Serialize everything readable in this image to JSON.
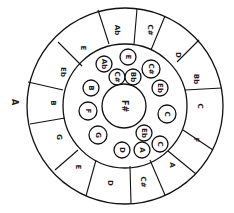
{
  "diagram": {
    "marker_label": "A",
    "center_label": "F#",
    "outer_ring": [
      {
        "label": "Ab",
        "x": 117,
        "y": 30,
        "rot": 90
      },
      {
        "label": "C#",
        "x": 150,
        "y": 30,
        "rot": 90
      },
      {
        "label": "D",
        "x": 178,
        "y": 55,
        "rot": 90
      },
      {
        "label": "Bb",
        "x": 196,
        "y": 79,
        "rot": 90
      },
      {
        "label": "C",
        "x": 200,
        "y": 106,
        "rot": 90
      },
      {
        "label": "F",
        "x": 196,
        "y": 140,
        "rot": 90
      },
      {
        "label": "A",
        "x": 172,
        "y": 165,
        "rot": 90
      },
      {
        "label": "C#",
        "x": 143,
        "y": 182,
        "rot": 90
      },
      {
        "label": "D",
        "x": 110,
        "y": 183,
        "rot": 90
      },
      {
        "label": "E",
        "x": 78,
        "y": 167,
        "rot": 90
      },
      {
        "label": "G",
        "x": 59,
        "y": 137,
        "rot": 90
      },
      {
        "label": "B",
        "x": 53,
        "y": 103,
        "rot": 90
      },
      {
        "label": "Eb",
        "x": 63,
        "y": 72,
        "rot": 90
      },
      {
        "label": "E",
        "x": 83,
        "y": 48,
        "rot": 90
      }
    ],
    "inner_circles": [
      {
        "label": "Ab",
        "x": 104,
        "y": 64,
        "r": 8
      },
      {
        "label": "E",
        "x": 128,
        "y": 57,
        "r": 8
      },
      {
        "label": "C#",
        "x": 117,
        "y": 77,
        "r": 8
      },
      {
        "label": "Bb",
        "x": 133,
        "y": 77,
        "r": 8
      },
      {
        "label": "C#",
        "x": 151,
        "y": 69,
        "r": 9
      },
      {
        "label": "Eb",
        "x": 160,
        "y": 88,
        "r": 8
      },
      {
        "label": "C",
        "x": 167,
        "y": 114,
        "r": 9
      },
      {
        "label": "Eb",
        "x": 144,
        "y": 133,
        "r": 8
      },
      {
        "label": "C",
        "x": 160,
        "y": 144,
        "r": 8
      },
      {
        "label": "A",
        "x": 142,
        "y": 150,
        "r": 8
      },
      {
        "label": "D",
        "x": 122,
        "y": 150,
        "r": 8
      },
      {
        "label": "G",
        "x": 98,
        "y": 135,
        "r": 9
      },
      {
        "label": "F",
        "x": 88,
        "y": 111,
        "r": 9
      },
      {
        "label": "B",
        "x": 91,
        "y": 88,
        "r": 8
      }
    ]
  }
}
